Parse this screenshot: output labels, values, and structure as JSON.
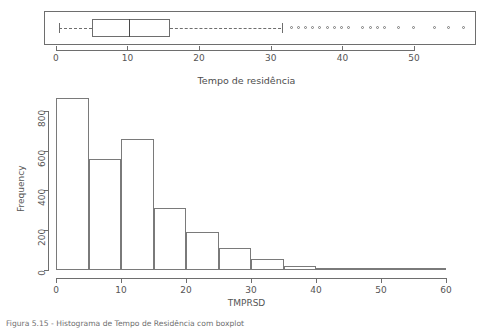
{
  "figure": {
    "title": "Tempo de residência",
    "caption_visible_fragment": "Figura 5.15 - Histograma de Tempo de Residência com boxplot"
  },
  "boxplot": {
    "name": "tempo-de-residencia-boxplot",
    "orientation": "horizontal",
    "stats": {
      "whisker_low": 0.5,
      "q1": 5.0,
      "median": 10.2,
      "q3": 16.0,
      "whisker_high": 31.5
    },
    "outliers": [
      33.0,
      34.0,
      35.0,
      36.0,
      37.0,
      38.0,
      39.0,
      40.0,
      41.0,
      43.0,
      44.0,
      45.0,
      46.0,
      48.0,
      50.0,
      53.0,
      55.0,
      57.0
    ],
    "axis": {
      "min": -1.5,
      "max": 58.5,
      "ticks": [
        0,
        10,
        20,
        30,
        40,
        50
      ],
      "tick_labels": [
        "0",
        "10",
        "20",
        "30",
        "40",
        "50"
      ]
    }
  },
  "chart_data": {
    "type": "bar",
    "title": "Tempo de residência",
    "xlabel": "TMPRSD",
    "ylabel": "Frequency",
    "grid": false,
    "legend": "none",
    "bin_width": 5,
    "bin_edges": [
      0,
      5,
      10,
      15,
      20,
      25,
      30,
      35,
      40,
      45,
      50,
      55,
      60
    ],
    "categories": [
      "0-5",
      "5-10",
      "10-15",
      "15-20",
      "20-25",
      "25-30",
      "30-35",
      "35-40",
      "40-45",
      "45-50",
      "50-55",
      "55-60"
    ],
    "values": [
      865,
      560,
      660,
      310,
      190,
      110,
      55,
      18,
      8,
      12,
      2,
      1
    ],
    "xlim": [
      0,
      60
    ],
    "ylim": [
      0,
      865
    ],
    "xticks": [
      0,
      10,
      20,
      30,
      40,
      50,
      60
    ],
    "xtick_labels": [
      "0",
      "10",
      "20",
      "30",
      "40",
      "50",
      "60"
    ],
    "yticks": [
      0,
      200,
      400,
      600,
      800
    ],
    "ytick_labels": [
      "0",
      "200",
      "400",
      "600",
      "800"
    ]
  },
  "colors": {
    "bar_stroke": "#7a7a7a",
    "axis": "#6e6e6e",
    "text": "#4d4d4d",
    "background": "#ffffff"
  }
}
